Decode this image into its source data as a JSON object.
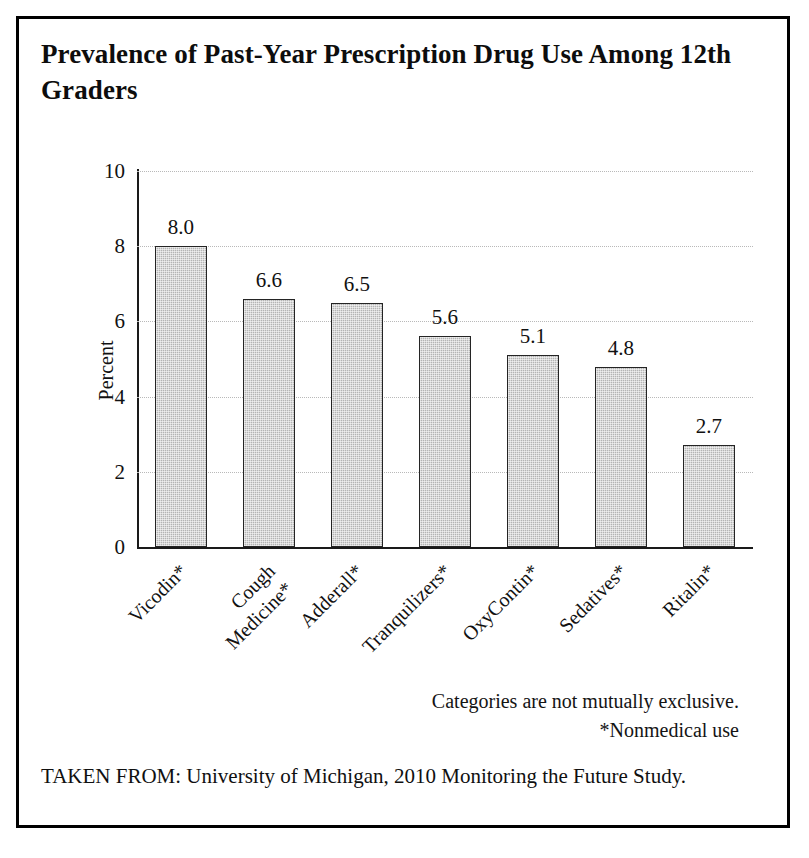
{
  "figure": {
    "title": "Prevalence of Past-Year Prescription Drug Use Among 12th Graders",
    "source_line": "TAKEN FROM: University of Michigan, 2010 Monitoring the Future Study.",
    "footnotes": [
      "Categories are not mutually exclusive.",
      "*Nonmedical use"
    ],
    "border_color": "#000000",
    "background_color": "#ffffff"
  },
  "chart_data": {
    "type": "bar",
    "title": "Prevalence of Past-Year Prescription Drug Use Among 12th Graders",
    "xlabel": "",
    "ylabel": "Percent",
    "categories": [
      "Vicodin*",
      "Cough\nMedicine*",
      "Adderall*",
      "Tranquilizers*",
      "OxyContin*",
      "Sedatives*",
      "Ritalin*"
    ],
    "values": [
      8.0,
      6.6,
      6.5,
      5.6,
      5.1,
      4.8,
      2.7
    ],
    "value_labels": [
      "8.0",
      "6.6",
      "6.5",
      "5.6",
      "5.1",
      "4.8",
      "2.7"
    ],
    "ylim": [
      0,
      10
    ],
    "ytick_values": [
      0,
      2,
      4,
      6,
      8,
      10
    ],
    "ytick_labels": [
      "0",
      "2",
      "4",
      "6",
      "8",
      "10"
    ],
    "grid": true,
    "grid_axis": "y",
    "legend": false,
    "bar_fill_color": "#b4b4b4",
    "bar_edge_color": "#242424",
    "gridline_color": "#b9b9b9"
  }
}
